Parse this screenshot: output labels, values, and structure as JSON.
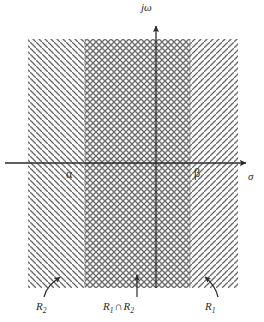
{
  "figure": {
    "axes": {
      "vertical_label": "jω",
      "horizontal_label": "σ",
      "vertical_axis_x": 156,
      "horizontal_axis_y": 163,
      "vertical_arrow_tip_y": 20,
      "horizontal_arrow_tip_x": 252
    },
    "boundaries": {
      "alpha_label": "α",
      "beta_label": "β",
      "alpha_x": 85,
      "beta_x": 190
    },
    "regions": [
      {
        "id": "R2",
        "label": "R",
        "subscript": "2",
        "hatch": "backslash",
        "x_start": 28,
        "x_end": 190,
        "y_start": 39,
        "y_end": 288,
        "color": "#5a5a5a"
      },
      {
        "id": "R1",
        "label": "R",
        "subscript": "1",
        "hatch": "slash",
        "x_start": 85,
        "x_end": 238,
        "y_start": 39,
        "y_end": 288,
        "color": "#5a5a5a"
      }
    ],
    "intersection": {
      "label_prefix": "R",
      "label_sub1": "1",
      "operator": "∩",
      "label_sub2": "2",
      "x_start": 85,
      "x_end": 190,
      "hatch": "crosshatch"
    },
    "callouts": [
      {
        "name": "R2-callout",
        "text": "R",
        "sub": "2",
        "arrow": "curved-up-right",
        "tip_x": 62,
        "tip_y": 275
      },
      {
        "name": "R1R2-callout",
        "text": "R1∩R2",
        "arrow": "straight-up",
        "tip_x": 137,
        "tip_y": 272
      },
      {
        "name": "R1-callout",
        "text": "R",
        "sub": "1",
        "arrow": "curved-up-left",
        "tip_x": 203,
        "tip_y": 274
      }
    ],
    "colors": {
      "axis": "#2b2b2b",
      "hatch": "#6d6d6d",
      "text": "#2a2a2a",
      "background": "#ffffff"
    }
  }
}
